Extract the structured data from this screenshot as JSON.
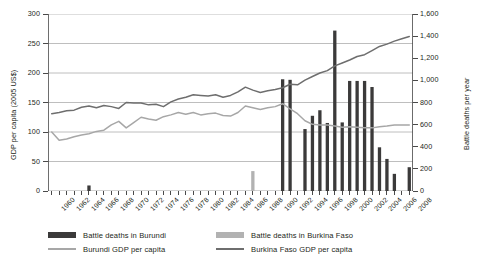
{
  "chart_data": {
    "type": "bar",
    "title": "",
    "subtitle": "",
    "xlabel": "",
    "ylabel": "GDP per capita (2005 US$)",
    "y2label": "Battle deaths per year",
    "ylim": [
      0,
      300
    ],
    "y2lim": [
      0,
      1600
    ],
    "xlim": [
      1960,
      2008
    ],
    "grid": true,
    "legend_position": "bottom",
    "y_ticks": [
      0,
      50,
      100,
      150,
      200,
      250,
      300
    ],
    "y_tick_labels": [
      "0",
      "50",
      "100",
      "150",
      "200",
      "250",
      "300"
    ],
    "y2_ticks": [
      0,
      200,
      400,
      600,
      800,
      1000,
      1200,
      1400,
      1600
    ],
    "y2_tick_labels": [
      "0",
      "200",
      "400",
      "600",
      "800",
      "1,000",
      "1,200",
      "1,400",
      "1,600"
    ],
    "x": [
      1960,
      1961,
      1962,
      1963,
      1964,
      1965,
      1966,
      1967,
      1968,
      1969,
      1970,
      1971,
      1972,
      1973,
      1974,
      1975,
      1976,
      1977,
      1978,
      1979,
      1980,
      1981,
      1982,
      1983,
      1984,
      1985,
      1986,
      1987,
      1988,
      1989,
      1990,
      1991,
      1992,
      1993,
      1994,
      1995,
      1996,
      1997,
      1998,
      1999,
      2000,
      2001,
      2002,
      2003,
      2004,
      2005,
      2006,
      2007,
      2008
    ],
    "x_tick_labels": [
      "1960",
      "1962",
      "1964",
      "1966",
      "1968",
      "1970",
      "1972",
      "1974",
      "1976",
      "1978",
      "1980",
      "1982",
      "1984",
      "1986",
      "1988",
      "1990",
      "1992",
      "1994",
      "1996",
      "1998",
      "2000",
      "2002",
      "2004",
      "2006",
      "2008"
    ],
    "series": [
      {
        "name": "Battle deaths in Burundi",
        "type": "bar",
        "axis": "right",
        "color": "#3b3a3a",
        "values": [
          0,
          0,
          0,
          0,
          0,
          50,
          0,
          0,
          0,
          0,
          0,
          0,
          0,
          0,
          0,
          0,
          0,
          0,
          0,
          0,
          0,
          0,
          0,
          0,
          0,
          0,
          0,
          0,
          0,
          0,
          0,
          1010,
          1005,
          0,
          560,
          680,
          730,
          615,
          1450,
          620,
          995,
          995,
          995,
          940,
          395,
          290,
          155,
          0,
          215
        ]
      },
      {
        "name": "Battle deaths in Burkina Faso",
        "type": "bar",
        "axis": "right",
        "color": "#b2b2b2",
        "values": [
          0,
          0,
          0,
          0,
          0,
          0,
          0,
          0,
          0,
          0,
          0,
          0,
          0,
          0,
          0,
          0,
          0,
          0,
          0,
          0,
          0,
          0,
          0,
          0,
          0,
          0,
          0,
          180,
          0,
          0,
          0,
          0,
          0,
          0,
          0,
          0,
          0,
          0,
          0,
          0,
          0,
          0,
          0,
          0,
          0,
          0,
          0,
          0,
          0
        ]
      },
      {
        "name": "Burundi GDP per capita",
        "type": "line",
        "axis": "left",
        "color": "#a7a7a7",
        "values": [
          100,
          86,
          88,
          92,
          95,
          97,
          101,
          103,
          112,
          118,
          107,
          116,
          125,
          122,
          120,
          126,
          129,
          133,
          130,
          133,
          129,
          131,
          132,
          128,
          127,
          133,
          144,
          141,
          138,
          141,
          143,
          148,
          139,
          131,
          119,
          113,
          112,
          112,
          110,
          108,
          109,
          108,
          107,
          107,
          109,
          110,
          112,
          112,
          112
        ]
      },
      {
        "name": "Burkina Faso GDP per capita",
        "type": "line",
        "axis": "left",
        "color": "#6e6e6e",
        "values": [
          131,
          133,
          136,
          137,
          142,
          144,
          141,
          145,
          143,
          140,
          150,
          149,
          149,
          146,
          147,
          143,
          151,
          156,
          159,
          163,
          162,
          161,
          163,
          159,
          162,
          168,
          176,
          171,
          167,
          170,
          172,
          175,
          181,
          180,
          188,
          194,
          200,
          204,
          212,
          217,
          222,
          228,
          231,
          238,
          245,
          249,
          254,
          258,
          262
        ]
      }
    ]
  },
  "axes": {
    "left_title": "GDP per capita (2005 US$)",
    "right_title": "Battle deaths per year"
  },
  "legend": {
    "entries": [
      {
        "label": "Battle deaths in Burundi",
        "kind": "bar",
        "color": "#3b3a3a"
      },
      {
        "label": "Burundi GDP per capita",
        "kind": "line",
        "color": "#a7a7a7"
      },
      {
        "label": "Battle deaths in Burkina Faso",
        "kind": "bar",
        "color": "#b2b2b2"
      },
      {
        "label": "Burkina Faso GDP per capita",
        "kind": "line",
        "color": "#6e6e6e"
      }
    ]
  }
}
